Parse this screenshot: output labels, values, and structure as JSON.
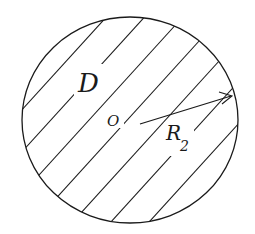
{
  "diagram": {
    "region_label": "D",
    "center_label": "O",
    "radius_label": "R",
    "radius_subscript": "2",
    "shading": "diagonal hatch",
    "colors": {
      "stroke": "#1a1a1a",
      "background": "#ffffff"
    }
  }
}
